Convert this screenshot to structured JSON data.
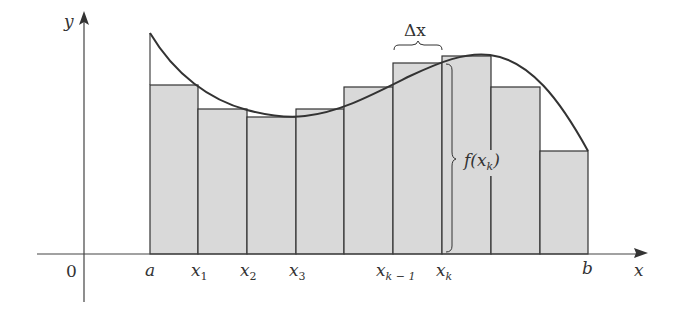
{
  "figure": {
    "axes": {
      "x_label": "x",
      "y_label": "y",
      "origin_label": "0"
    },
    "tick_labels": {
      "a": "a",
      "x1": "x",
      "x1_sub": "1",
      "x2": "x",
      "x2_sub": "2",
      "x3": "x",
      "x3_sub": "3",
      "xkm1": "x",
      "xkm1_sub": "k − 1",
      "xk": "x",
      "xk_sub": "k",
      "b": "b"
    },
    "annotations": {
      "delta_x": "Δx",
      "f_xk_prefix": "f(x",
      "f_xk_sub": "k",
      "f_xk_suffix": ")"
    },
    "colors": {
      "rect_fill": "#d9d9d9",
      "stroke": "#333333",
      "background": "#ffffff"
    },
    "rectangles": [
      {
        "x0": 150,
        "x1": 198,
        "top": 85
      },
      {
        "x0": 198,
        "x1": 247,
        "top": 109
      },
      {
        "x0": 247,
        "x1": 296,
        "top": 117
      },
      {
        "x0": 296,
        "x1": 344,
        "top": 109
      },
      {
        "x0": 344,
        "x1": 393,
        "top": 87
      },
      {
        "x0": 393,
        "x1": 442,
        "top": 63
      },
      {
        "x0": 442,
        "x1": 491,
        "top": 56
      },
      {
        "x0": 491,
        "x1": 540,
        "top": 87
      },
      {
        "x0": 540,
        "x1": 588,
        "top": 151
      }
    ]
  }
}
